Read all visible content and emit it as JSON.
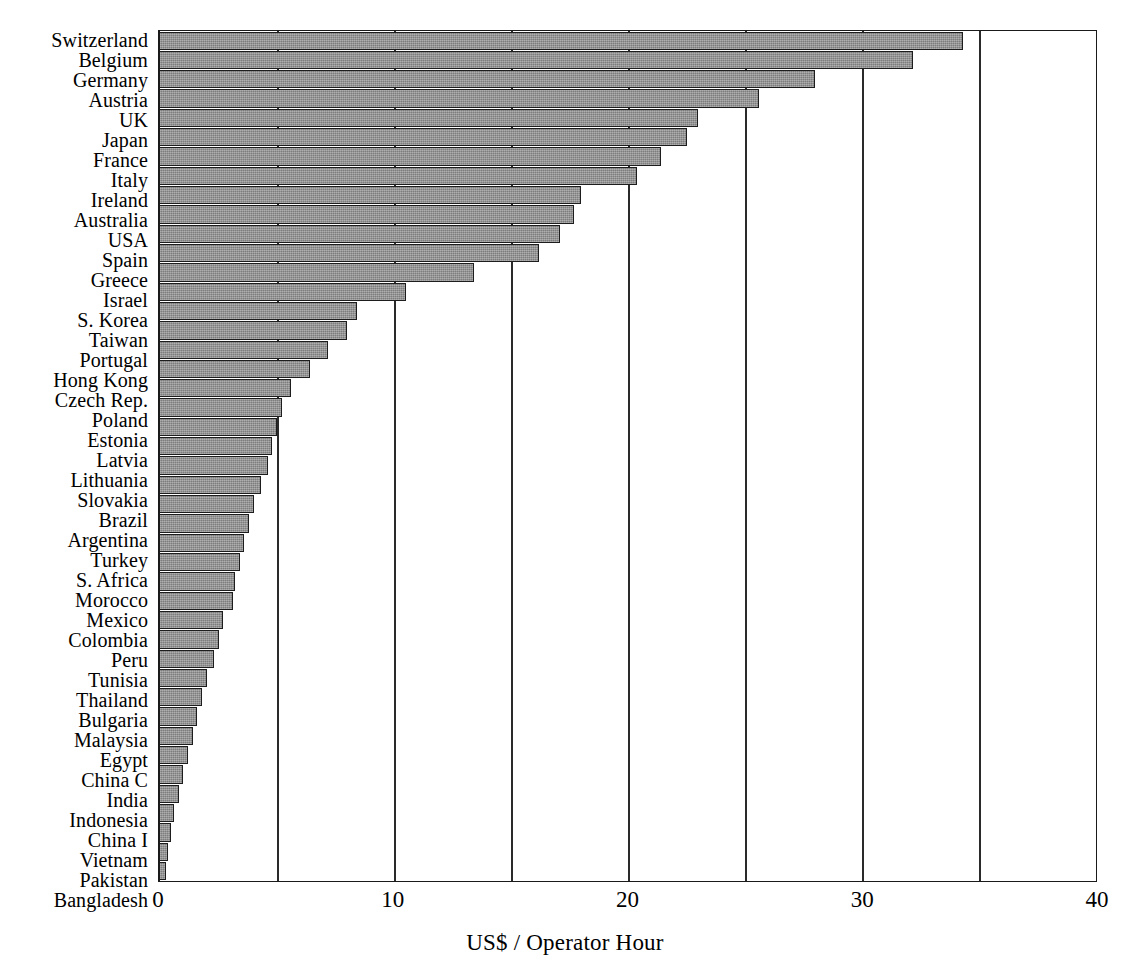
{
  "chart_data": {
    "type": "bar",
    "orientation": "horizontal",
    "title": "",
    "subtitle": "",
    "xlabel": "US$ / Operator Hour",
    "ylabel": "",
    "xlim": [
      0,
      40
    ],
    "ylim": null,
    "grid": "vertical gridlines every 5 units",
    "legend": null,
    "x_tick_labels": [
      "0",
      "10",
      "20",
      "30",
      "40"
    ],
    "x_tick_values": [
      0,
      10,
      20,
      30,
      40
    ],
    "x_gridline_values": [
      5,
      10,
      15,
      20,
      25,
      30,
      35
    ],
    "bar_fill_color": "#8f8f8f",
    "bar_edge_color": "#1d1d1d",
    "axis_color": "#1a1a1a",
    "background_color": "#ffffff",
    "categories": [
      "Switzerland",
      "Belgium",
      "Germany",
      "Austria",
      "UK",
      "Japan",
      "France",
      "Italy",
      "Ireland",
      "Australia",
      "USA",
      "Spain",
      "Greece",
      "Israel",
      "S. Korea",
      "Taiwan",
      "Portugal",
      "Hong Kong",
      "Czech Rep.",
      "Poland",
      "Estonia",
      "Latvia",
      "Lithuania",
      "Slovakia",
      "Brazil",
      "Argentina",
      "Turkey",
      "S. Africa",
      "Morocco",
      "Mexico",
      "Colombia",
      "Peru",
      "Tunisia",
      "Thailand",
      "Bulgaria",
      "Malaysia",
      "Egypt",
      "China C",
      "India",
      "Indonesia",
      "China I",
      "Vietnam",
      "Pakistan",
      "Bangladesh"
    ],
    "values": [
      34.3,
      32.2,
      28.0,
      25.6,
      23.0,
      22.5,
      21.4,
      20.4,
      18.0,
      17.7,
      17.1,
      16.2,
      13.4,
      10.5,
      8.4,
      8.0,
      7.2,
      6.4,
      5.6,
      5.2,
      5.0,
      4.8,
      4.6,
      4.3,
      4.0,
      3.8,
      3.6,
      3.4,
      3.2,
      3.1,
      2.7,
      2.5,
      2.3,
      2.0,
      1.8,
      1.6,
      1.4,
      1.2,
      1.0,
      0.8,
      0.6,
      0.45,
      0.35,
      0.25
    ]
  }
}
